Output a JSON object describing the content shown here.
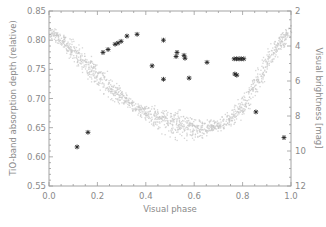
{
  "chart_data": {
    "type": "scatter",
    "title": "",
    "xlabel": "Visual phase",
    "ylabel": "TiO-band absorption depth (relative)",
    "ylabel_right": "Visual brightness [mag]",
    "xlim": [
      0.0,
      1.0
    ],
    "ylim": [
      0.55,
      0.85
    ],
    "ylim_right": [
      2,
      12
    ],
    "x_ticks": [
      "0.0",
      "0.2",
      "0.4",
      "0.6",
      "0.8",
      "1.0"
    ],
    "y_ticks": [
      "0.55",
      "0.60",
      "0.65",
      "0.70",
      "0.75",
      "0.80",
      "0.85"
    ],
    "y_right_ticks": [
      "2",
      "4",
      "6",
      "8",
      "10",
      "12"
    ],
    "grid": false,
    "legend": "none",
    "series": [
      {
        "name": "TiO-band absorption depth",
        "marker": "asterisk",
        "axis": "left",
        "color": "#222222",
        "points": [
          [
            0.116,
            0.617
          ],
          [
            0.161,
            0.642
          ],
          [
            0.223,
            0.779
          ],
          [
            0.244,
            0.784
          ],
          [
            0.273,
            0.793
          ],
          [
            0.285,
            0.795
          ],
          [
            0.298,
            0.798
          ],
          [
            0.322,
            0.807
          ],
          [
            0.364,
            0.81
          ],
          [
            0.426,
            0.756
          ],
          [
            0.473,
            0.8
          ],
          [
            0.473,
            0.733
          ],
          [
            0.525,
            0.772
          ],
          [
            0.529,
            0.779
          ],
          [
            0.558,
            0.774
          ],
          [
            0.562,
            0.769
          ],
          [
            0.579,
            0.735
          ],
          [
            0.653,
            0.762
          ],
          [
            0.765,
            0.768
          ],
          [
            0.775,
            0.768
          ],
          [
            0.785,
            0.768
          ],
          [
            0.795,
            0.768
          ],
          [
            0.805,
            0.768
          ],
          [
            0.768,
            0.742
          ],
          [
            0.776,
            0.74
          ],
          [
            0.855,
            0.677
          ],
          [
            0.971,
            0.633
          ]
        ]
      },
      {
        "name": "Visual brightness (light curve)",
        "marker": "dot",
        "axis": "right",
        "color": "#c8c8c8",
        "band": {
          "description": "dense cloud of light-grey points forming a U-shaped light curve",
          "center_curve": [
            [
              0.0,
              3.2
            ],
            [
              0.05,
              3.6
            ],
            [
              0.1,
              4.3
            ],
            [
              0.15,
              5.0
            ],
            [
              0.2,
              5.7
            ],
            [
              0.25,
              6.3
            ],
            [
              0.3,
              6.9
            ],
            [
              0.35,
              7.4
            ],
            [
              0.4,
              7.8
            ],
            [
              0.45,
              8.1
            ],
            [
              0.5,
              8.35
            ],
            [
              0.55,
              8.55
            ],
            [
              0.6,
              8.65
            ],
            [
              0.65,
              8.65
            ],
            [
              0.7,
              8.5
            ],
            [
              0.75,
              8.1
            ],
            [
              0.8,
              7.4
            ],
            [
              0.85,
              6.3
            ],
            [
              0.9,
              4.9
            ],
            [
              0.95,
              3.8
            ],
            [
              1.0,
              3.0
            ]
          ],
          "half_width_mag": 0.45
        }
      }
    ]
  }
}
